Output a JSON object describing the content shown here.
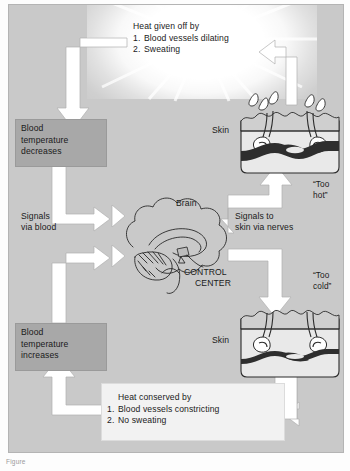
{
  "figure": {
    "background_color": "#c9c9c9",
    "panel_border_color": "#b4b4b4",
    "arrow_color": "#ffffff",
    "highlight_box_color": "#a8a8a8",
    "text_box_color": "#f2f2f2",
    "caption": "Figure"
  },
  "boxes": {
    "heat_given_off": {
      "heading": "Heat given off by",
      "items": [
        {
          "num": "1.",
          "text": "Blood vessels dilating"
        },
        {
          "num": "2.",
          "text": "Sweating"
        }
      ]
    },
    "heat_conserved": {
      "heading": "Heat conserved by",
      "items": [
        {
          "num": "1.",
          "text": "Blood vessels constricting"
        },
        {
          "num": "2.",
          "text": "No sweating"
        }
      ]
    },
    "blood_temp_decreases": {
      "line1": "Blood",
      "line2": "temperature",
      "line3": "decreases"
    },
    "blood_temp_increases": {
      "line1": "Blood",
      "line2": "temperature",
      "line3": "increases"
    }
  },
  "labels": {
    "brain": "Brain",
    "control_center_line1": "CONTROL",
    "control_center_line2": "CENTER",
    "signals_via_blood_line1": "Signals",
    "signals_via_blood_line2": "via blood",
    "signals_to_skin_line1": "Signals to",
    "signals_to_skin_line2": "skin via nerves",
    "skin_top": "Skin",
    "skin_bottom": "Skin",
    "too_hot_line1": "“Too",
    "too_hot_line2": "hot”",
    "too_cold_line1": "“Too",
    "too_cold_line2": "cold”"
  },
  "diagram_parts": {
    "skin_hot": {
      "name": "skin-cross-section-hot",
      "vessel_state": "dilated",
      "sweat": "present"
    },
    "skin_cold": {
      "name": "skin-cross-section-cold",
      "vessel_state": "constricted",
      "sweat": "absent"
    },
    "brain": {
      "name": "brain-illustration",
      "role": "control center / hypothalamus"
    }
  }
}
